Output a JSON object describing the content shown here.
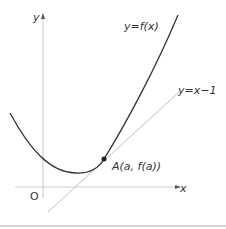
{
  "diagram": {
    "type": "function-graph-with-tangent",
    "labels": {
      "y_axis": "y",
      "x_axis": "x",
      "origin": "O",
      "curve": "y=f(x)",
      "tangent": "y=x−1",
      "point": "A(a, f(a))"
    },
    "colors": {
      "axis": "#d0d0d0",
      "curve": "#333333",
      "tangent": "#c0c0c0",
      "point": "#222222",
      "separator": "#c8c8c8",
      "text": "#333333"
    }
  }
}
